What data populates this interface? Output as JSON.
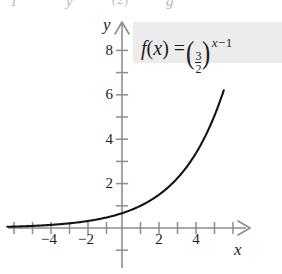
{
  "figure": {
    "kind": "textbook-graph-figure",
    "top_partial_row": {
      "frag1": "1",
      "frag2": "y",
      "frag3": "(2)",
      "frag4": "g"
    },
    "formula": {
      "function_name": "f",
      "argument": "x",
      "equals": "=",
      "base_numerator": "3",
      "base_denominator": "2",
      "exponent_variable": "x",
      "exponent_operator": "−",
      "exponent_constant": "1",
      "plain": "f(x) = (3/2)^(x - 1)",
      "box_color": "#ececec"
    },
    "axes": {
      "x_label": "x",
      "y_label": "y",
      "axis_color": "#8d8d8d",
      "curve_color": "#141414"
    }
  },
  "chart_data": {
    "type": "line",
    "title": "",
    "subtitle": "",
    "xlabel": "x",
    "ylabel": "y",
    "equation": "f(x) = (3/2)^(x - 1)",
    "base": 1.5,
    "horizontal_shift": 1,
    "xlim": [
      -6.3,
      6.6
    ],
    "ylim": [
      -1.6,
      9.6
    ],
    "xticks": [
      -6,
      -5,
      -4,
      -3,
      -2,
      -1,
      1,
      2,
      3,
      4,
      5,
      6
    ],
    "yticks": [
      1,
      2,
      3,
      4,
      5,
      6,
      7,
      8,
      9
    ],
    "xtick_labels": [
      "−4",
      "−2",
      "2",
      "4"
    ],
    "xtick_label_values": [
      -4,
      -2,
      2,
      4
    ],
    "ytick_labels": [
      "2",
      "4",
      "6",
      "8"
    ],
    "ytick_label_values": [
      2,
      4,
      6,
      8
    ],
    "grid": false,
    "legend": false,
    "x": [
      -6.2,
      -5.5,
      -5,
      -4.5,
      -4,
      -3.5,
      -3,
      -2.5,
      -2,
      -1.5,
      -1,
      -0.5,
      0,
      0.5,
      1,
      1.5,
      2,
      2.5,
      3,
      3.5,
      4,
      4.5,
      5,
      5.3
    ],
    "y": [
      0.02,
      0.04,
      0.06,
      0.07,
      0.09,
      0.11,
      0.13,
      0.16,
      0.2,
      0.24,
      0.3,
      0.36,
      0.44,
      0.54,
      0.67,
      0.82,
      1.0,
      1.22,
      1.5,
      1.84,
      2.25,
      2.76,
      3.38,
      3.75
    ],
    "curve_endpoints": {
      "left": [
        -6.2,
        0.02
      ],
      "right": [
        5.5,
        7.5
      ]
    },
    "asymptote": {
      "type": "horizontal",
      "value": 0
    }
  }
}
